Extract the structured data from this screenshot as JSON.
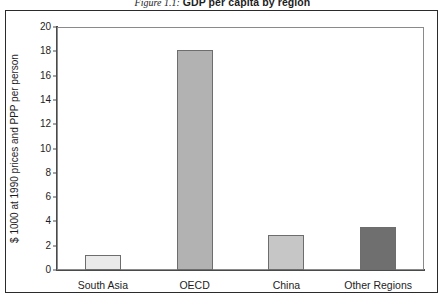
{
  "caption": {
    "number": "Figure 1.1:",
    "title": "GDP per capita by region"
  },
  "chart_data": {
    "type": "bar",
    "title": "GDP per capita by region",
    "xlabel": "",
    "ylabel": "$ 1000 at 1990 prices and PPP per person",
    "categories": [
      "South Asia",
      "OECD",
      "China",
      "Other Regions"
    ],
    "values": [
      1.2,
      18.1,
      2.9,
      3.5
    ],
    "series": [
      {
        "name": "GDP per capita",
        "values": [
          1.2,
          18.1,
          2.9,
          3.5
        ]
      }
    ],
    "bar_colors": [
      "#eaeaea",
      "#b2b2b2",
      "#c6c6c6",
      "#6f6f6f"
    ],
    "bar_border_color": "#6d6d6d",
    "ylim": [
      0,
      20
    ],
    "ytick_step": 2,
    "yticks": [
      "20",
      "18",
      "16",
      "14",
      "12",
      "10",
      "8",
      "6",
      "4",
      "2",
      "0"
    ],
    "ytick_values": [
      20,
      18,
      16,
      14,
      12,
      10,
      8,
      6,
      4,
      2,
      0
    ],
    "grid": false,
    "legend": "none"
  }
}
